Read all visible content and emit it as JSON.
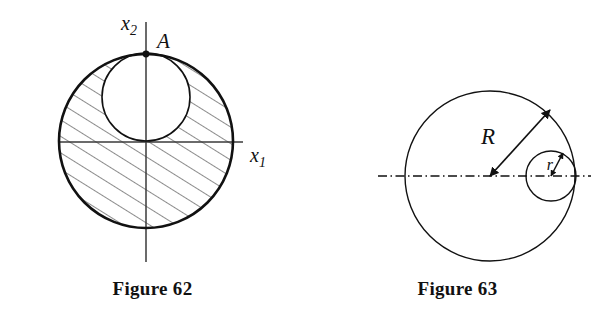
{
  "page": {
    "background_color": "#ffffff",
    "ink_color": "#111111",
    "width": 610,
    "height": 316
  },
  "figures": [
    {
      "id": "figure-62",
      "caption": "Figure 62",
      "description": "Large circle centered at origin with a smaller internally tangent circle through point A; region between them is hatched",
      "axes": {
        "x_axis_label": "x",
        "x_axis_subscript": "1",
        "y_axis_label": "x",
        "y_axis_subscript": "2",
        "origin_x": 146,
        "origin_y": 142
      },
      "points": [
        {
          "name": "A",
          "label": "A",
          "x": 146,
          "y": 54
        }
      ],
      "shapes": {
        "outer_circle": {
          "cx": 146,
          "cy": 141,
          "r": 87,
          "stroke_width": 2.6
        },
        "inner_circle": {
          "cx": 146,
          "cy": 97,
          "r": 44,
          "stroke_width": 1.6
        }
      },
      "hatching": {
        "angle_deg": 58,
        "spacing_px": 14,
        "stroke_width": 1.0
      }
    },
    {
      "id": "figure-63",
      "caption": "Figure 63",
      "description": "Large circle of radius R with a small internally tangent circle of radius r on the horizontal dash-dot centerline",
      "labels": [
        {
          "name": "R",
          "label": "R",
          "x": 64,
          "y": 72
        },
        {
          "name": "r",
          "label": "r",
          "x": 145,
          "y": 88
        }
      ],
      "shapes": {
        "large_circle": {
          "cx": 185,
          "cy": 176,
          "r": 85,
          "stroke_width": 1.4
        },
        "small_circle": {
          "cx": 246,
          "cy": 176,
          "r": 25,
          "stroke_width": 1.4
        }
      },
      "centerline": {
        "style": "dash-dot",
        "y": 176,
        "x_start": 73,
        "x_end": 286
      },
      "arrows": [
        {
          "name": "radius-R-arrow",
          "from_x": 185,
          "from_y": 176,
          "to_x": 245,
          "to_y": 110,
          "double_headed": true
        },
        {
          "name": "radius-r-arrow",
          "from_x": 246,
          "from_y": 176,
          "to_x": 258,
          "to_y": 153,
          "double_headed": true
        }
      ]
    }
  ]
}
